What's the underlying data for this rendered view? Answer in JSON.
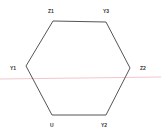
{
  "diagram": {
    "shape": "hexagon",
    "vertices": [
      {
        "label": "Z1",
        "x": 53,
        "y": 21
      },
      {
        "label": "Y3",
        "x": 106,
        "y": 22
      },
      {
        "label": "Z2",
        "x": 130,
        "y": 68
      },
      {
        "label": "Y2",
        "x": 106,
        "y": 115
      },
      {
        "label": "U",
        "x": 52,
        "y": 115
      },
      {
        "label": "Y1",
        "x": 26,
        "y": 66
      }
    ],
    "stroke_color": "#555555",
    "scan_line_color": "#f2c6cc"
  },
  "labels": {
    "z1": "Z1",
    "y3": "Y3",
    "z2": "Z2",
    "y2": "Y2",
    "u": "U",
    "y1": "Y1"
  }
}
